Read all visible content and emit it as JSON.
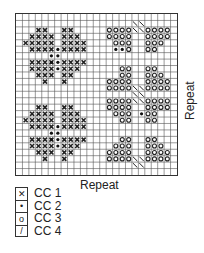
{
  "chart": {
    "grid_cols": 25,
    "grid_rows": 25,
    "repeat_bottom_label": "Repeat",
    "repeat_side_label": "Repeat"
  },
  "legend": [
    {
      "symbol": "x",
      "label": "CC 1"
    },
    {
      "symbol": "dot",
      "label": "CC 2"
    },
    {
      "symbol": "circle",
      "label": "CC 3"
    },
    {
      "symbol": "slash",
      "label": "CC 4"
    }
  ],
  "cells": {
    "x": [
      [
        3,
        2
      ],
      [
        4,
        2
      ],
      [
        3,
        3
      ],
      [
        4,
        3
      ],
      [
        5,
        3
      ],
      [
        2,
        3
      ],
      [
        1,
        4
      ],
      [
        2,
        4
      ],
      [
        3,
        4
      ],
      [
        4,
        4
      ],
      [
        5,
        4
      ],
      [
        2,
        5
      ],
      [
        3,
        5
      ],
      [
        4,
        5
      ],
      [
        5,
        5
      ],
      [
        7,
        2
      ],
      [
        8,
        2
      ],
      [
        7,
        3
      ],
      [
        8,
        3
      ],
      [
        9,
        3
      ],
      [
        7,
        4
      ],
      [
        8,
        4
      ],
      [
        9,
        4
      ],
      [
        10,
        4
      ],
      [
        7,
        5
      ],
      [
        8,
        5
      ],
      [
        9,
        5
      ],
      [
        10,
        5
      ],
      [
        2,
        7
      ],
      [
        3,
        7
      ],
      [
        4,
        7
      ],
      [
        5,
        7
      ],
      [
        2,
        8
      ],
      [
        3,
        8
      ],
      [
        4,
        8
      ],
      [
        5,
        8
      ],
      [
        3,
        9
      ],
      [
        4,
        9
      ],
      [
        5,
        9
      ],
      [
        4,
        10
      ],
      [
        7,
        7
      ],
      [
        8,
        7
      ],
      [
        9,
        7
      ],
      [
        10,
        7
      ],
      [
        7,
        8
      ],
      [
        8,
        8
      ],
      [
        9,
        8
      ],
      [
        7,
        9
      ],
      [
        8,
        9
      ],
      [
        7,
        10
      ],
      [
        3,
        14
      ],
      [
        4,
        14
      ],
      [
        2,
        15
      ],
      [
        3,
        15
      ],
      [
        4,
        15
      ],
      [
        5,
        15
      ],
      [
        1,
        16
      ],
      [
        2,
        16
      ],
      [
        3,
        16
      ],
      [
        4,
        16
      ],
      [
        5,
        16
      ],
      [
        2,
        17
      ],
      [
        3,
        17
      ],
      [
        4,
        17
      ],
      [
        5,
        17
      ],
      [
        7,
        14
      ],
      [
        8,
        14
      ],
      [
        7,
        15
      ],
      [
        8,
        15
      ],
      [
        9,
        15
      ],
      [
        7,
        16
      ],
      [
        8,
        16
      ],
      [
        9,
        16
      ],
      [
        10,
        16
      ],
      [
        7,
        17
      ],
      [
        8,
        17
      ],
      [
        9,
        17
      ],
      [
        10,
        17
      ],
      [
        2,
        19
      ],
      [
        3,
        19
      ],
      [
        4,
        19
      ],
      [
        5,
        19
      ],
      [
        2,
        20
      ],
      [
        3,
        20
      ],
      [
        4,
        20
      ],
      [
        5,
        20
      ],
      [
        3,
        21
      ],
      [
        4,
        21
      ],
      [
        5,
        21
      ],
      [
        4,
        22
      ],
      [
        7,
        19
      ],
      [
        8,
        19
      ],
      [
        9,
        19
      ],
      [
        10,
        19
      ],
      [
        7,
        20
      ],
      [
        8,
        20
      ],
      [
        9,
        20
      ],
      [
        7,
        21
      ],
      [
        8,
        21
      ],
      [
        7,
        22
      ]
    ],
    "dot": [
      [
        5,
        6
      ],
      [
        6,
        6
      ],
      [
        5,
        7
      ],
      [
        6,
        7
      ],
      [
        6,
        5
      ],
      [
        6,
        8
      ],
      [
        5,
        18
      ],
      [
        6,
        18
      ],
      [
        5,
        19
      ],
      [
        6,
        19
      ],
      [
        6,
        17
      ],
      [
        6,
        20
      ],
      [
        15,
        5
      ],
      [
        16,
        5
      ],
      [
        19,
        15
      ]
    ],
    "circle": [
      [
        14,
        2
      ],
      [
        15,
        2
      ],
      [
        16,
        2
      ],
      [
        17,
        2
      ],
      [
        14,
        3
      ],
      [
        15,
        3
      ],
      [
        16,
        3
      ],
      [
        17,
        3
      ],
      [
        15,
        4
      ],
      [
        16,
        4
      ],
      [
        17,
        4
      ],
      [
        17,
        5
      ],
      [
        20,
        2
      ],
      [
        21,
        2
      ],
      [
        22,
        2
      ],
      [
        23,
        2
      ],
      [
        20,
        3
      ],
      [
        21,
        3
      ],
      [
        22,
        3
      ],
      [
        23,
        3
      ],
      [
        20,
        4
      ],
      [
        21,
        4
      ],
      [
        22,
        4
      ],
      [
        20,
        5
      ],
      [
        21,
        5
      ],
      [
        16,
        8
      ],
      [
        17,
        8
      ],
      [
        16,
        9
      ],
      [
        17,
        9
      ],
      [
        14,
        10
      ],
      [
        15,
        10
      ],
      [
        16,
        10
      ],
      [
        17,
        10
      ],
      [
        14,
        11
      ],
      [
        15,
        11
      ],
      [
        16,
        11
      ],
      [
        17,
        11
      ],
      [
        20,
        8
      ],
      [
        21,
        8
      ],
      [
        20,
        9
      ],
      [
        21,
        9
      ],
      [
        22,
        9
      ],
      [
        20,
        10
      ],
      [
        21,
        10
      ],
      [
        22,
        10
      ],
      [
        23,
        10
      ],
      [
        20,
        11
      ],
      [
        21,
        11
      ],
      [
        22,
        11
      ],
      [
        23,
        11
      ],
      [
        14,
        13
      ],
      [
        15,
        13
      ],
      [
        16,
        13
      ],
      [
        17,
        13
      ],
      [
        14,
        14
      ],
      [
        15,
        14
      ],
      [
        16,
        14
      ],
      [
        17,
        14
      ],
      [
        15,
        15
      ],
      [
        16,
        15
      ],
      [
        17,
        15
      ],
      [
        16,
        16
      ],
      [
        17,
        16
      ],
      [
        20,
        13
      ],
      [
        21,
        13
      ],
      [
        22,
        13
      ],
      [
        23,
        13
      ],
      [
        20,
        14
      ],
      [
        21,
        14
      ],
      [
        22,
        14
      ],
      [
        23,
        14
      ],
      [
        20,
        15
      ],
      [
        21,
        15
      ],
      [
        20,
        16
      ],
      [
        21,
        16
      ],
      [
        16,
        19
      ],
      [
        17,
        19
      ],
      [
        15,
        20
      ],
      [
        16,
        20
      ],
      [
        17,
        20
      ],
      [
        14,
        21
      ],
      [
        15,
        21
      ],
      [
        16,
        21
      ],
      [
        17,
        21
      ],
      [
        14,
        22
      ],
      [
        15,
        22
      ],
      [
        16,
        22
      ],
      [
        17,
        22
      ],
      [
        20,
        19
      ],
      [
        21,
        19
      ],
      [
        20,
        20
      ],
      [
        21,
        20
      ],
      [
        22,
        20
      ],
      [
        20,
        21
      ],
      [
        21,
        21
      ],
      [
        22,
        21
      ],
      [
        23,
        21
      ],
      [
        20,
        22
      ],
      [
        21,
        22
      ],
      [
        22,
        22
      ],
      [
        23,
        22
      ]
    ],
    "slash": [
      [
        18,
        1
      ],
      [
        19,
        1
      ],
      [
        18,
        2
      ],
      [
        19,
        2
      ],
      [
        18,
        11
      ],
      [
        19,
        11
      ],
      [
        18,
        12
      ],
      [
        19,
        12
      ],
      [
        18,
        13
      ],
      [
        19,
        13
      ],
      [
        18,
        22
      ],
      [
        19,
        22
      ],
      [
        18,
        23
      ],
      [
        19,
        23
      ]
    ]
  }
}
